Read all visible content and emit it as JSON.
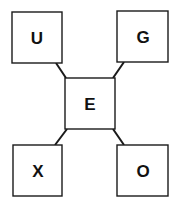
{
  "diagram": {
    "center": {
      "label": "E",
      "x": 65,
      "y": 78,
      "w": 50,
      "h": 51
    },
    "nodes": [
      {
        "id": "top-left",
        "label": "U",
        "x": 12,
        "y": 12,
        "w": 50,
        "h": 51
      },
      {
        "id": "top-right",
        "label": "G",
        "x": 117,
        "y": 11,
        "w": 51,
        "h": 51
      },
      {
        "id": "bottom-left",
        "label": "X",
        "x": 13,
        "y": 145,
        "w": 49,
        "h": 51
      },
      {
        "id": "bottom-right",
        "label": "O",
        "x": 117,
        "y": 145,
        "w": 51,
        "h": 51
      }
    ],
    "links": [
      {
        "from": "U",
        "to": "E",
        "x1": 56,
        "y1": 63,
        "x2": 66,
        "y2": 78
      },
      {
        "from": "G",
        "to": "E",
        "x1": 124,
        "y1": 62,
        "x2": 113,
        "y2": 78
      },
      {
        "from": "X",
        "to": "E",
        "x1": 55,
        "y1": 145,
        "x2": 67,
        "y2": 129
      },
      {
        "from": "O",
        "to": "E",
        "x1": 124,
        "y1": 145,
        "x2": 113,
        "y2": 129
      }
    ],
    "colors": {
      "stroke": "#1a1a1a",
      "fill": "#ffffff",
      "text": "#111111"
    }
  }
}
